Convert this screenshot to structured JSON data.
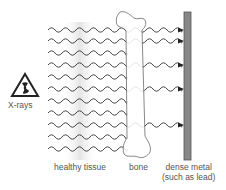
{
  "diagram": {
    "source_label": "X-rays",
    "source_icon": "radiation-warning-icon",
    "labels": {
      "tissue": "healthy tissue",
      "bone": "bone",
      "metal_line1": "dense metal",
      "metal_line2": "(such as lead)"
    },
    "colors": {
      "wave": "#444444",
      "metal_fill": "#888888",
      "metal_stroke": "#555555",
      "tissue_shade": "#e6e6e6",
      "bone_stroke": "#555555",
      "text": "#555555"
    },
    "rays": [
      {
        "y": 30,
        "reaches_metal": true
      },
      {
        "y": 41,
        "reaches_metal": true
      },
      {
        "y": 53,
        "reaches_metal": false
      },
      {
        "y": 65,
        "reaches_metal": true
      },
      {
        "y": 77,
        "reaches_metal": false
      },
      {
        "y": 89,
        "reaches_metal": true
      },
      {
        "y": 101,
        "reaches_metal": false
      },
      {
        "y": 113,
        "reaches_metal": false
      },
      {
        "y": 125,
        "reaches_metal": true
      },
      {
        "y": 137,
        "reaches_metal": false
      },
      {
        "y": 149,
        "reaches_metal": false
      }
    ]
  }
}
